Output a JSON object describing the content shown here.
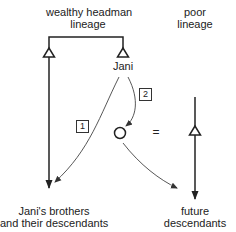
{
  "labels": {
    "wealthy_lineage_line1": "wealthy headman",
    "wealthy_lineage_line2": "lineage",
    "poor_lineage_line1": "poor",
    "poor_lineage_line2": "lineage",
    "jani": "Jani",
    "brothers_line1": "Jani's brothers",
    "brothers_line2": "and their descendants",
    "future_line1": "future",
    "future_line2": "descendants",
    "equals": "="
  },
  "steps": [
    {
      "id": "1",
      "label": "1"
    },
    {
      "id": "2",
      "label": "2"
    }
  ],
  "symbols": {
    "male": "triangle",
    "female": "circle",
    "marriage": "equals"
  },
  "colors": {
    "line": "#222222",
    "thin_line": "#444444",
    "background": "#ffffff"
  }
}
